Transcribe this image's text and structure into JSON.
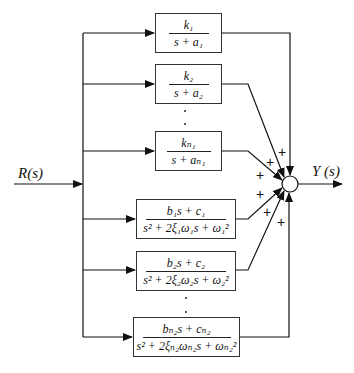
{
  "diagram": {
    "title": "",
    "input_label": "R(s)",
    "output_label": "Y (s)",
    "blocks": [
      {
        "id": "b1",
        "numerator": "k₁",
        "denominator": "s + a₁"
      },
      {
        "id": "b2",
        "numerator": "k₂",
        "denominator": "s + a₂"
      },
      {
        "id": "b3",
        "numerator": "kₙ₁",
        "denominator": "s + aₙ₁"
      },
      {
        "id": "b4",
        "numerator": "b₁s + c₁",
        "denominator": "s² + 2ξ₁ω₁s + ω₁²"
      },
      {
        "id": "b5",
        "numerator": "b₂s + c₂",
        "denominator": "s² + 2ξ₂ω₂s + ω₂²"
      },
      {
        "id": "b6",
        "numerator": "bₙ₂s + cₙ₂",
        "denominator": "s² + 2ξₙ₂ωₙ₂s + ωₙ₂²"
      }
    ],
    "summing_junction_signs": [
      "+",
      "+",
      "+",
      "+",
      "+",
      "+"
    ],
    "ellipsis": "⋮",
    "colors": {
      "line": "#111111",
      "background": "#ffffff"
    }
  }
}
